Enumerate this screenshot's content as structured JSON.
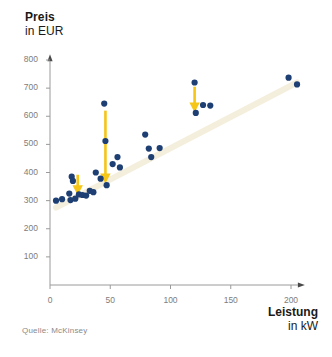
{
  "axes": {
    "y_title_line1": "Preis",
    "y_title_line2": "in EUR",
    "x_title_line1": "Leistung",
    "x_title_line2": "in kW"
  },
  "source": {
    "label": "Quelle: McKinsey"
  },
  "colors": {
    "point": "#1d3f73",
    "arrow": "#f5c518",
    "trendline": "#f4eedc",
    "axis": "#9a9a9a",
    "tick_text": "#7d7d7d",
    "title_text": "#1a1a1a",
    "source_text": "#8a8a8a",
    "background": "#ffffff"
  },
  "chart_data": {
    "type": "scatter",
    "title": "",
    "subtitle": "",
    "xlabel": "Leistung in kW",
    "ylabel": "Preis in EUR",
    "xlim": [
      0,
      215
    ],
    "ylim": [
      0,
      820
    ],
    "grid": false,
    "legend": "none",
    "x_ticks": [
      0,
      50,
      100,
      150,
      200
    ],
    "x_tick_labels": [
      "0",
      "50",
      "100",
      "150",
      "200"
    ],
    "y_ticks": [
      100,
      200,
      300,
      400,
      500,
      600,
      700,
      800
    ],
    "y_tick_labels": [
      "100",
      "200",
      "300",
      "400",
      "500",
      "600",
      "700",
      "800"
    ],
    "points": [
      {
        "x": 5,
        "y": 300
      },
      {
        "x": 10,
        "y": 305
      },
      {
        "x": 16,
        "y": 325
      },
      {
        "x": 17,
        "y": 302
      },
      {
        "x": 18,
        "y": 385
      },
      {
        "x": 19,
        "y": 370
      },
      {
        "x": 21,
        "y": 307
      },
      {
        "x": 24,
        "y": 322
      },
      {
        "x": 27,
        "y": 320
      },
      {
        "x": 30,
        "y": 318
      },
      {
        "x": 33,
        "y": 335
      },
      {
        "x": 36,
        "y": 330
      },
      {
        "x": 38,
        "y": 400
      },
      {
        "x": 42,
        "y": 378
      },
      {
        "x": 45,
        "y": 645
      },
      {
        "x": 46,
        "y": 512
      },
      {
        "x": 47,
        "y": 355
      },
      {
        "x": 52,
        "y": 430
      },
      {
        "x": 56,
        "y": 455
      },
      {
        "x": 58,
        "y": 418
      },
      {
        "x": 79,
        "y": 535
      },
      {
        "x": 82,
        "y": 485
      },
      {
        "x": 84,
        "y": 455
      },
      {
        "x": 91,
        "y": 487
      },
      {
        "x": 120,
        "y": 720
      },
      {
        "x": 121,
        "y": 612
      },
      {
        "x": 127,
        "y": 640
      },
      {
        "x": 133,
        "y": 638
      },
      {
        "x": 198,
        "y": 737
      },
      {
        "x": 205,
        "y": 713
      }
    ],
    "arrows": [
      {
        "x": 23,
        "y_from": 392,
        "y_to": 333,
        "note": "downward price correction"
      },
      {
        "x": 46,
        "y_from": 620,
        "y_to": 375,
        "note": "downward price correction"
      },
      {
        "x": 120,
        "y_from": 705,
        "y_to": 628,
        "note": "downward price correction"
      }
    ],
    "trendline": {
      "x_from": 5,
      "y_from": 275,
      "x_to": 205,
      "y_to": 720
    }
  }
}
